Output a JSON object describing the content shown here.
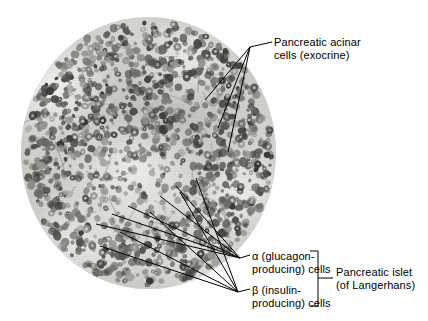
{
  "figure": {
    "type": "histology-micrograph-labeled-diagram",
    "background_color": "#ffffff",
    "line_color": "#000000",
    "micrograph": {
      "shape": "circle",
      "description": "Round light-micrograph field of pancreatic tissue, grayscale, showing densely packed darkly stained nuclei of acinar cells surrounding a paler, less densely stained pancreatic islet near the center-lower field.",
      "tint_background": "#d9d8d3",
      "nuclei_color_dark": "#3a3a38",
      "nuclei_color_mid": "#6e6e6a",
      "nuclei_color_light": "#9a9a95"
    }
  },
  "labels": {
    "acinar": {
      "name": "pancreatic-acinar-cells",
      "line1": "Pancreatic acinar",
      "line2": "cells (exocrine)"
    },
    "alpha": {
      "name": "alpha-cells",
      "line1": "α (glucagon-",
      "line2": "producing) cells"
    },
    "beta": {
      "name": "beta-cells",
      "line1": "β (insulin-",
      "line2": "producing) cells"
    },
    "islet": {
      "name": "pancreatic-islet",
      "line1": "Pancreatic islet",
      "line2": "(of Langerhans)"
    }
  },
  "leaders": {
    "acinar": {
      "hub": [
        250,
        47
      ],
      "stem_to": [
        272,
        42
      ],
      "targets": [
        [
          205,
          100
        ],
        [
          218,
          128
        ],
        [
          228,
          152
        ]
      ]
    },
    "alpha": {
      "hub": [
        240,
        258
      ],
      "stem_to": [
        250,
        255
      ],
      "targets": [
        [
          176,
          186
        ],
        [
          160,
          196
        ],
        [
          128,
          206
        ],
        [
          112,
          214
        ],
        [
          96,
          224
        ]
      ]
    },
    "beta": {
      "hub": [
        238,
        292
      ],
      "stem_to": [
        250,
        289
      ],
      "targets": [
        [
          196,
          178
        ],
        [
          180,
          192
        ],
        [
          150,
          212
        ],
        [
          120,
          232
        ],
        [
          100,
          246
        ]
      ]
    }
  },
  "bracket": {
    "name": "islet-bracket",
    "x": 318,
    "top": 251,
    "bottom": 306,
    "tick_x_end": 310,
    "stem_to_x": 333,
    "stem_y": 278
  }
}
